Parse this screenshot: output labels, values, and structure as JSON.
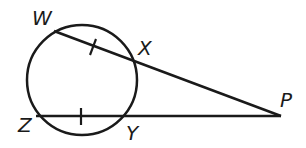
{
  "diagram": {
    "type": "geometry",
    "circle": {
      "cx": 82,
      "cy": 80,
      "r": 55
    },
    "points": {
      "W": {
        "label": "W",
        "x": 54,
        "y": 31
      },
      "X": {
        "label": "X",
        "x": 134,
        "y": 62
      },
      "Z": {
        "label": "Z",
        "x": 38,
        "y": 116
      },
      "Y": {
        "label": "Y",
        "x": 126,
        "y": 116
      },
      "P": {
        "label": "P",
        "x": 280,
        "y": 116
      }
    },
    "segments": [
      "WP",
      "ZP"
    ],
    "congruence_marks": [
      "WX",
      "ZY"
    ],
    "stroke_color": "#1a1a1a"
  }
}
